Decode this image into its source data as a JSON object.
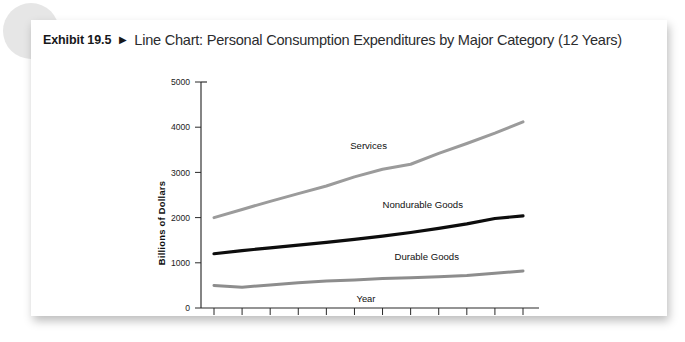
{
  "header": {
    "exhibit_number": "Exhibit 19.5",
    "arrow_icon": "right-triangle-icon",
    "title": "Line Chart: Personal Consumption Expenditures by Major Category (12 Years)"
  },
  "colors": {
    "panel_background": "#ffffff",
    "page_background": "#ffffff",
    "decoration_circle": "#e6e6e6",
    "axis": "#2a2a2a",
    "text": "#101010",
    "services_line": "#9b9b9b",
    "nondurable_line": "#0d0d0d",
    "durable_line": "#8d8d8d"
  },
  "chart_data": {
    "type": "line",
    "title": "Line Chart: Personal Consumption Expenditures by Major Category (12 Years)",
    "xlabel": "Year",
    "ylabel": "Billions of Dollars",
    "x": [
      1,
      2,
      3,
      4,
      5,
      6,
      7,
      8,
      9,
      10,
      11,
      12
    ],
    "xtick_labels": [
      "1",
      "2",
      "3",
      "4",
      "5",
      "6",
      "7",
      "8",
      "9",
      "10",
      "11",
      "12"
    ],
    "ytick_labels": [
      "0",
      "1000",
      "2000",
      "3000",
      "4000",
      "5000"
    ],
    "yticks": [
      0,
      1000,
      2000,
      3000,
      4000,
      5000
    ],
    "ylim": [
      0,
      5000
    ],
    "xlim": [
      1,
      12
    ],
    "grid": false,
    "legend": "inline-labels",
    "series": [
      {
        "name": "Services",
        "color": "#9b9b9b",
        "label_position": "above-line",
        "values": [
          2000,
          2180,
          2360,
          2530,
          2700,
          2900,
          3070,
          3180,
          3420,
          3640,
          3870,
          4120
        ]
      },
      {
        "name": "Nondurable Goods",
        "color": "#0d0d0d",
        "label_position": "above-line",
        "values": [
          1200,
          1270,
          1330,
          1390,
          1450,
          1520,
          1590,
          1670,
          1760,
          1860,
          1980,
          2040
        ]
      },
      {
        "name": "Durable Goods",
        "color": "#8d8d8d",
        "label_position": "above-line",
        "values": [
          500,
          460,
          510,
          560,
          600,
          620,
          650,
          670,
          690,
          720,
          770,
          820
        ]
      }
    ]
  }
}
